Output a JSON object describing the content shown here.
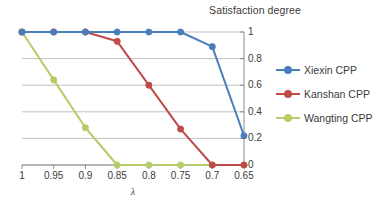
{
  "chart_data": {
    "type": "line",
    "title": "Satisfaction degree",
    "xlabel": "λ",
    "ylabel": "",
    "x": [
      1,
      0.95,
      0.9,
      0.85,
      0.8,
      0.75,
      0.7,
      0.65
    ],
    "xticklabels": [
      "1",
      "0.95",
      "0.9",
      "0.85",
      "0.8",
      "0.75",
      "0.7",
      "0.65"
    ],
    "yticklabels": [
      "0",
      "0.2",
      "0.4",
      "0.6",
      "0.8",
      "1"
    ],
    "yticks": [
      0,
      0.2,
      0.4,
      0.6,
      0.8,
      1
    ],
    "ylim": [
      0,
      1
    ],
    "grid": "horizontal",
    "legend_position": "right",
    "series": [
      {
        "name": "Xiexin CPP",
        "color": "#4A7EBB",
        "values": [
          1,
          1,
          1,
          1,
          1,
          1,
          0.89,
          0.22
        ]
      },
      {
        "name": "Kanshan CPP",
        "color": "#BE4B48",
        "values": [
          1,
          1,
          1,
          0.93,
          0.6,
          0.27,
          0,
          0
        ]
      },
      {
        "name": "Wangting CPP",
        "color": "#B5CC6A",
        "values": [
          1,
          0.64,
          0.28,
          0,
          0,
          0,
          0,
          0
        ]
      }
    ]
  },
  "legend": {
    "items": [
      {
        "label": "Xiexin CPP"
      },
      {
        "label": "Kanshan CPP"
      },
      {
        "label": "Wangting CPP"
      }
    ]
  },
  "colors": {
    "series_blue": "#4A7EBB",
    "series_red": "#BE4B48",
    "series_green": "#B5CC6A",
    "gridline": "#b0b0b0",
    "axis": "#8c8c8c",
    "text": "#3b3b3b"
  }
}
